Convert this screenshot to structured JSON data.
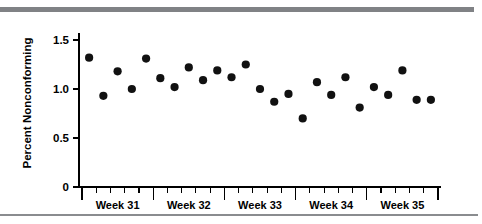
{
  "figure": {
    "name": "percent-nonconforming-run-chart",
    "background_color": "#ffffff",
    "rule_color": "#808285"
  },
  "chart_data": {
    "type": "scatter",
    "title": "",
    "subtitle": "",
    "xlabel": "",
    "ylabel": "Percent Nonconforming",
    "ylim": [
      0,
      1.6
    ],
    "yticks": [
      0,
      0.5,
      1.0,
      1.5
    ],
    "ytick_labels": [
      "0",
      "0.5",
      "1.0",
      "1.5"
    ],
    "grid": false,
    "legend": null,
    "marker": "filled-circle",
    "marker_color": "#111111",
    "x_group_labels": [
      "Week 31",
      "Week 32",
      "Week 33",
      "Week 34",
      "Week 35"
    ],
    "points_per_group": 5,
    "x": [
      1,
      2,
      3,
      4,
      5,
      6,
      7,
      8,
      9,
      10,
      11,
      12,
      13,
      14,
      15,
      16,
      17,
      18,
      19,
      20,
      21,
      22,
      23,
      24,
      25
    ],
    "values": [
      1.32,
      0.93,
      1.18,
      1.0,
      1.31,
      1.11,
      1.02,
      1.22,
      1.09,
      1.19,
      1.12,
      1.25,
      1.0,
      0.87,
      0.95,
      0.7,
      1.07,
      0.94,
      1.12,
      0.81,
      1.02,
      0.94,
      1.19,
      0.89,
      0.89
    ],
    "series": [
      {
        "name": "Percent Nonconforming",
        "values": [
          1.32,
          0.93,
          1.18,
          1.0,
          1.31,
          1.11,
          1.02,
          1.22,
          1.09,
          1.19,
          1.12,
          1.25,
          1.0,
          0.87,
          0.95,
          0.7,
          1.07,
          0.94,
          1.12,
          0.81,
          1.02,
          0.94,
          1.19,
          0.89,
          0.89
        ]
      }
    ],
    "groups": [
      {
        "label": "Week 31",
        "values": [
          1.32,
          0.93,
          1.18,
          1.0,
          1.31
        ]
      },
      {
        "label": "Week 32",
        "values": [
          1.11,
          1.02,
          1.22,
          1.09,
          1.19
        ]
      },
      {
        "label": "Week 33",
        "values": [
          1.12,
          1.25,
          1.0,
          0.87,
          0.95
        ]
      },
      {
        "label": "Week 34",
        "values": [
          0.7,
          1.07,
          0.94,
          1.12,
          0.81
        ]
      },
      {
        "label": "Week 35",
        "values": [
          1.02,
          0.94,
          1.19,
          0.89,
          0.89
        ]
      }
    ]
  }
}
